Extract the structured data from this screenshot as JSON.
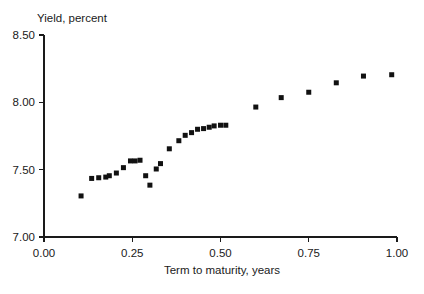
{
  "chart_data": {
    "type": "scatter",
    "title": "",
    "ylabel": "Yield, percent",
    "xlabel": "Term to maturity, years",
    "xlim": [
      0.0,
      1.0
    ],
    "ylim": [
      7.0,
      8.5
    ],
    "grid": false,
    "legend": null,
    "x_ticks": [
      {
        "value": 0.0,
        "label": "0.00"
      },
      {
        "value": 0.25,
        "label": "0.25"
      },
      {
        "value": 0.5,
        "label": "0.50"
      },
      {
        "value": 0.75,
        "label": "0.75"
      },
      {
        "value": 1.0,
        "label": "1.00"
      }
    ],
    "y_ticks": [
      {
        "value": 7.0,
        "label": "7.00"
      },
      {
        "value": 7.5,
        "label": "7.50"
      },
      {
        "value": 8.0,
        "label": "8.00"
      },
      {
        "value": 8.5,
        "label": "8.50"
      }
    ],
    "marker": {
      "shape": "square",
      "size": 5,
      "color": "#111111"
    },
    "points": [
      {
        "x": 0.105,
        "y": 7.305
      },
      {
        "x": 0.135,
        "y": 7.435
      },
      {
        "x": 0.155,
        "y": 7.44
      },
      {
        "x": 0.175,
        "y": 7.445
      },
      {
        "x": 0.185,
        "y": 7.455
      },
      {
        "x": 0.205,
        "y": 7.475
      },
      {
        "x": 0.225,
        "y": 7.515
      },
      {
        "x": 0.245,
        "y": 7.565
      },
      {
        "x": 0.258,
        "y": 7.565
      },
      {
        "x": 0.272,
        "y": 7.57
      },
      {
        "x": 0.288,
        "y": 7.455
      },
      {
        "x": 0.3,
        "y": 7.385
      },
      {
        "x": 0.318,
        "y": 7.505
      },
      {
        "x": 0.33,
        "y": 7.545
      },
      {
        "x": 0.355,
        "y": 7.655
      },
      {
        "x": 0.382,
        "y": 7.715
      },
      {
        "x": 0.4,
        "y": 7.755
      },
      {
        "x": 0.418,
        "y": 7.775
      },
      {
        "x": 0.435,
        "y": 7.8
      },
      {
        "x": 0.452,
        "y": 7.805
      },
      {
        "x": 0.468,
        "y": 7.815
      },
      {
        "x": 0.482,
        "y": 7.825
      },
      {
        "x": 0.5,
        "y": 7.83
      },
      {
        "x": 0.515,
        "y": 7.83
      },
      {
        "x": 0.6,
        "y": 7.965
      },
      {
        "x": 0.672,
        "y": 8.035
      },
      {
        "x": 0.75,
        "y": 8.075
      },
      {
        "x": 0.828,
        "y": 8.145
      },
      {
        "x": 0.905,
        "y": 8.195
      },
      {
        "x": 0.985,
        "y": 8.205
      }
    ]
  }
}
